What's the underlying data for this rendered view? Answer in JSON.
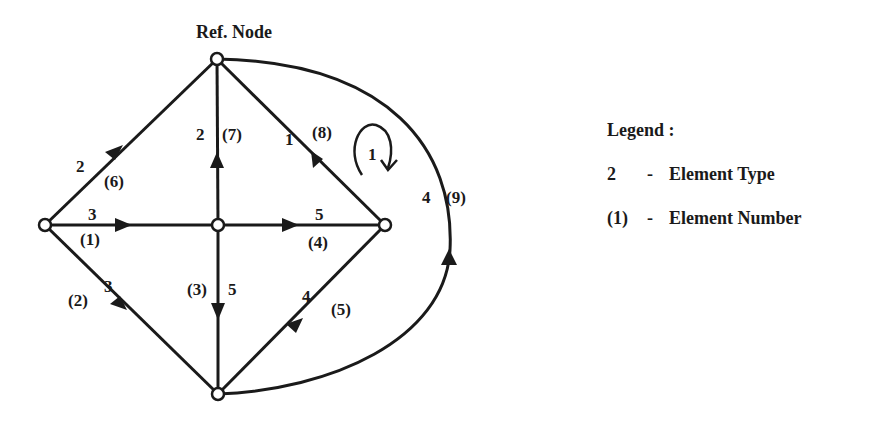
{
  "diagram": {
    "title": "Ref. Node",
    "loop_label": "1",
    "edges": [
      {
        "element_type": "3",
        "element_number": "(1)"
      },
      {
        "element_type": "3",
        "element_number": "(2)"
      },
      {
        "element_type": "5",
        "element_number": "(3)"
      },
      {
        "element_type": "5",
        "element_number": "(4)"
      },
      {
        "element_type": "4",
        "element_number": "(5)"
      },
      {
        "element_type": "2",
        "element_number": "(6)"
      },
      {
        "element_type": "2",
        "element_number": "(7)"
      },
      {
        "element_type": "1",
        "element_number": "(8)"
      },
      {
        "element_type": "4",
        "element_number": "(9)"
      }
    ]
  },
  "legend": {
    "title": "Legend :",
    "items": [
      {
        "symbol": "2",
        "separator": "-",
        "label": "Element Type"
      },
      {
        "symbol": "(1)",
        "separator": "-",
        "label": "Element Number"
      }
    ]
  }
}
